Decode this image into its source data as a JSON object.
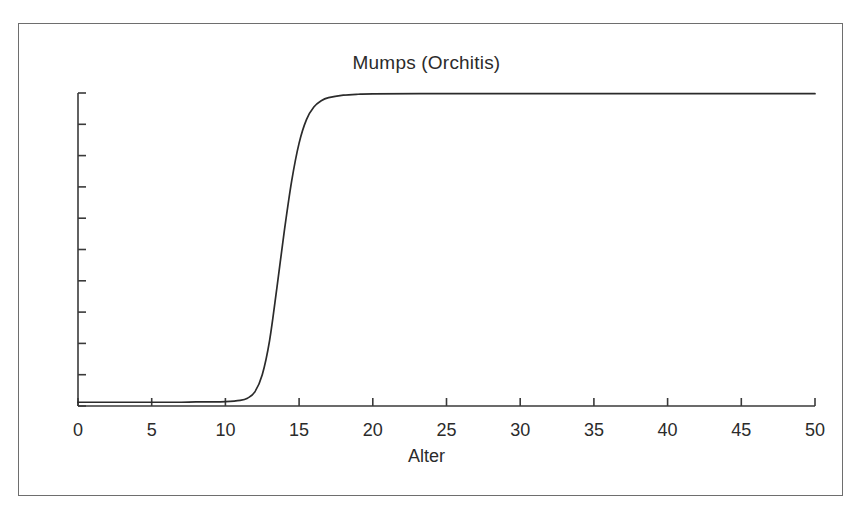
{
  "figure": {
    "background_color": "#ffffff",
    "frame_color": "#6e6e6e",
    "axis_color": "#3a3a3a",
    "curve_color": "#2b2b2b"
  },
  "chart_data": {
    "type": "line",
    "title": "Mumps (Orchitis)",
    "xlabel": "Alter",
    "ylabel": "",
    "xlim": [
      0,
      50
    ],
    "ylim": [
      0,
      1
    ],
    "grid": false,
    "legend": null,
    "xticks": [
      0,
      5,
      10,
      15,
      20,
      25,
      30,
      35,
      40,
      45,
      50
    ],
    "xtick_labels": [
      "0",
      "5",
      "10",
      "15",
      "20",
      "25",
      "30",
      "35",
      "40",
      "45",
      "50"
    ],
    "ytick_count": 11,
    "ytick_labels": [],
    "series": [
      {
        "name": "Mumps (Orchitis)",
        "description": "sigmoid cumulative curve rising steeply between age 12 and 16",
        "x": [
          0,
          1,
          2,
          3,
          4,
          5,
          6,
          7,
          8,
          9,
          10,
          11,
          11.5,
          12,
          12.5,
          13,
          13.5,
          14,
          14.5,
          15,
          15.5,
          16,
          16.5,
          17,
          18,
          19,
          20,
          25,
          30,
          35,
          40,
          45,
          50
        ],
        "y": [
          0.012,
          0.012,
          0.012,
          0.012,
          0.012,
          0.012,
          0.012,
          0.012,
          0.013,
          0.013,
          0.014,
          0.018,
          0.025,
          0.045,
          0.1,
          0.21,
          0.38,
          0.56,
          0.72,
          0.84,
          0.915,
          0.955,
          0.975,
          0.985,
          0.993,
          0.996,
          0.997,
          0.998,
          0.998,
          0.998,
          0.998,
          0.998,
          0.998
        ]
      }
    ],
    "annotations": []
  }
}
